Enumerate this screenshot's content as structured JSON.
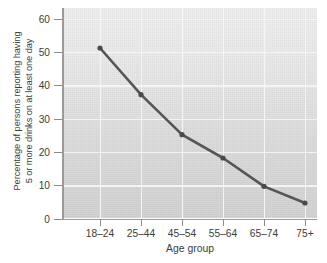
{
  "chart_data": {
    "type": "line",
    "title": "",
    "xlabel": "Age group",
    "ylabel_line1": "Percentage of persons reporting having",
    "ylabel_line2": "5 or more drinks on at least one day",
    "categories": [
      "18–24",
      "25–44",
      "45–54",
      "55–64",
      "65–74",
      "75+"
    ],
    "values": [
      51,
      37,
      25,
      18,
      9.5,
      4.5
    ],
    "series": [
      {
        "name": "Percentage of persons reporting having 5 or more drinks on at least one day",
        "values": [
          51,
          37,
          25,
          18,
          9.5,
          4.5
        ]
      }
    ],
    "ylim": [
      0,
      63
    ],
    "yticks": [
      0,
      10,
      20,
      30,
      40,
      50,
      60
    ],
    "ytick_labels": [
      "0",
      "10",
      "20",
      "30",
      "40",
      "50",
      "60"
    ],
    "grid": "both",
    "legend": "none",
    "line_color": "#555555",
    "marker": "circle",
    "marker_color": "#4a4a4a",
    "plot_bg": "#e3e3e3",
    "grid_color": "#f5f5f5",
    "axis_color": "#9a9a9a",
    "text_color": "#3c3c3c"
  }
}
